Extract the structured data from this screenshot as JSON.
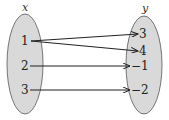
{
  "diagram": {
    "type": "mapping",
    "domain_label": "x",
    "range_label": "y",
    "domain": [
      "1",
      "2",
      "3"
    ],
    "range": [
      "3",
      "4",
      "−1",
      "−2"
    ],
    "mappings": [
      {
        "from": "1",
        "to": "3"
      },
      {
        "from": "1",
        "to": "4"
      },
      {
        "from": "2",
        "to": "−1"
      },
      {
        "from": "3",
        "to": "−2"
      }
    ],
    "colors": {
      "ellipse_fill": "#d9d9d9",
      "ellipse_stroke": "#555555",
      "arrow": "#222222"
    }
  }
}
